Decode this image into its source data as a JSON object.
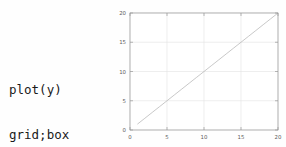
{
  "page": {
    "background_color": "#fefefe"
  },
  "code_snippet": {
    "name": "octave-plot-commands",
    "lines": [
      "plot(y)",
      "grid;box"
    ],
    "text_color": "#1a1a1a"
  },
  "figure": {
    "name": "line-plot-figure",
    "background_color": "#ffffff",
    "axis_color": "#9a9a9a",
    "grid_color": "#e3e3e3",
    "line_color": "#b0b0b0",
    "tick_label_color": "#5c5c5c"
  },
  "chart_data": {
    "type": "line",
    "title": "",
    "xlabel": "",
    "ylabel": "",
    "xlim": [
      0,
      20
    ],
    "ylim": [
      0,
      20
    ],
    "xticks": [
      0,
      5,
      10,
      15,
      20
    ],
    "yticks": [
      0,
      5,
      10,
      15,
      20
    ],
    "xticklabels": [
      "0",
      "5",
      "10",
      "15",
      "20"
    ],
    "yticklabels": [
      "0",
      "5",
      "10",
      "15",
      "20"
    ],
    "grid": true,
    "box": true,
    "legend": null,
    "series": [
      {
        "name": "y",
        "x": [
          1,
          2,
          3,
          4,
          5,
          6,
          7,
          8,
          9,
          10,
          11,
          12,
          13,
          14,
          15,
          16,
          17,
          18,
          19,
          20
        ],
        "values": [
          1,
          2,
          3,
          4,
          5,
          6,
          7,
          8,
          9,
          10,
          11,
          12,
          13,
          14,
          15,
          16,
          17,
          18,
          19,
          20
        ],
        "color": "#b0b0b0",
        "style": "solid",
        "width": 0.7
      }
    ]
  }
}
